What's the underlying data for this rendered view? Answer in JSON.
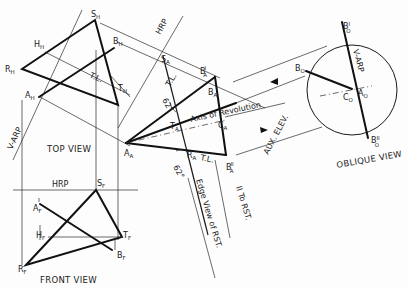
{
  "diagram": {
    "views": {
      "top": {
        "label": "TOP VIEW"
      },
      "front": {
        "label": "FRONT VIEW"
      },
      "oblique": {
        "label": "OBLIQUE VIEW"
      }
    },
    "reference_planes": {
      "hrp_front": "HRP",
      "hrp_aux": "HRP",
      "varp_top": "V-ARP",
      "varp_oblique": "V-ARP"
    },
    "annotations": {
      "tl_top": "T.L.",
      "tl_aux_upper": "T.L.",
      "tl_aux_lower": "T.L.",
      "angle_upper": "62°",
      "angle_lower": "62°",
      "axis_of_revolution": "Axis of Revolution",
      "aux_elev": "AUX. ELEV.",
      "edge_view": "Edge View of RST.",
      "parallel_to_rst": "II To RST."
    },
    "points": {
      "top": {
        "S": {
          "main": "S",
          "sub": "H"
        },
        "H": {
          "main": "H",
          "sub": "H"
        },
        "B": {
          "main": "B",
          "sub": "H"
        },
        "R": {
          "main": "R",
          "sub": "H"
        },
        "T": {
          "main": "T",
          "sub": "H"
        },
        "A": {
          "main": "A",
          "sub": "H"
        }
      },
      "front": {
        "S": {
          "main": "S",
          "sub": "F"
        },
        "A": {
          "main": "A",
          "sub": "F"
        },
        "H": {
          "main": "H",
          "sub": "F"
        },
        "T": {
          "main": "T",
          "sub": "F"
        },
        "B": {
          "main": "B",
          "sub": "F"
        },
        "R": {
          "main": "R",
          "sub": "F"
        }
      },
      "aux": {
        "S": {
          "main": "S",
          "sub": "A"
        },
        "B1": {
          "main": "B",
          "sub": "A",
          "sup": "I"
        },
        "B": {
          "main": "B",
          "sub": "A"
        },
        "T": {
          "main": "T",
          "sub": "A"
        },
        "C": {
          "main": "C",
          "sub": "A"
        },
        "A": {
          "main": "A",
          "sub": "A"
        },
        "R": {
          "main": "R",
          "sub": "A"
        },
        "B2": {
          "main": "B",
          "sub": "A",
          "sup": "II"
        }
      },
      "oblique": {
        "B1": {
          "main": "B",
          "sub": "O",
          "sup": "I"
        },
        "B": {
          "main": "B",
          "sub": "O"
        },
        "C": {
          "main": "C",
          "sub": "O"
        },
        "A": {
          "main": "A",
          "sub": "O"
        },
        "B2": {
          "main": "B",
          "sub": "O",
          "sup": "II"
        }
      }
    }
  }
}
